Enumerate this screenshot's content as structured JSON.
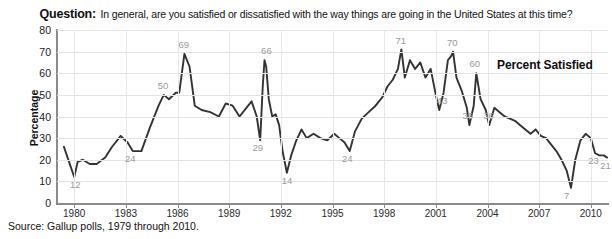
{
  "title": {
    "question_label": "Question:",
    "question_text": "In general, are you satisfied or dissatisfied with the way things are going in the United States at this time?"
  },
  "callout": {
    "text": "Percent Satisfied"
  },
  "source": {
    "text": "Source: Gallup polls, 1979 through 2010."
  },
  "colors": {
    "line": "#333333",
    "axis": "#8b8b8b",
    "grid": "#e3e3e3",
    "data_label": "#9a9a9a",
    "text": "#111111",
    "background": "#ffffff"
  },
  "chart_data": {
    "type": "line",
    "title": "In general, are you satisfied or dissatisfied with the way things are going in the United States at this time?",
    "xlabel": "",
    "ylabel": "Percentage",
    "series_name": "Percent Satisfied",
    "xlim": [
      1979,
      2011
    ],
    "ylim": [
      0,
      80
    ],
    "ytick_values": [
      0,
      10,
      20,
      30,
      40,
      50,
      60,
      70,
      80
    ],
    "ytick_labels": [
      "0",
      "10",
      "20",
      "30",
      "40",
      "50",
      "60",
      "70",
      "80"
    ],
    "xtick_values": [
      1980,
      1983,
      1986,
      1989,
      1992,
      1995,
      1998,
      2001,
      2004,
      2007,
      2010
    ],
    "xtick_labels": [
      "1980",
      "1983",
      "1986",
      "1989",
      "1992",
      "1995",
      "1998",
      "2001",
      "2004",
      "2007",
      "2010"
    ],
    "grid": true,
    "legend": "none",
    "annotations": [
      {
        "label": "12",
        "x": 1980.1,
        "y": 12,
        "note": "low, 1980"
      },
      {
        "label": "24",
        "x": 1983.3,
        "y": 24,
        "note": "1983 trough"
      },
      {
        "label": "50",
        "x": 1985.2,
        "y": 50,
        "note": "1985 rise"
      },
      {
        "label": "69",
        "x": 1986.4,
        "y": 69,
        "note": "1986 peak"
      },
      {
        "label": "29",
        "x": 1990.7,
        "y": 29,
        "note": "pre Gulf War dip"
      },
      {
        "label": "66",
        "x": 1991.2,
        "y": 66,
        "note": "Gulf War peak"
      },
      {
        "label": "14",
        "x": 1992.4,
        "y": 14,
        "note": "1992 low"
      },
      {
        "label": "24",
        "x": 1995.9,
        "y": 24,
        "note": "1995/96 dip"
      },
      {
        "label": "71",
        "x": 1999.0,
        "y": 71,
        "note": "1999 peak"
      },
      {
        "label": "70",
        "x": 2002.0,
        "y": 70,
        "note": "post-9/11 peak"
      },
      {
        "label": "43",
        "x": 2001.4,
        "y": 43,
        "note": "pre-9/11"
      },
      {
        "label": "60",
        "x": 2003.3,
        "y": 60,
        "note": "Iraq war rally"
      },
      {
        "label": "36",
        "x": 2002.9,
        "y": 36,
        "note": "2002 trough"
      },
      {
        "label": "36",
        "x": 2004.1,
        "y": 36,
        "note": "2004 level"
      },
      {
        "label": "7",
        "x": 2008.8,
        "y": 7,
        "note": "financial crisis low"
      },
      {
        "label": "23",
        "x": 2010.2,
        "y": 23,
        "note": "2010 level"
      },
      {
        "label": "21",
        "x": 2010.9,
        "y": 21,
        "note": "end of series"
      }
    ],
    "x": [
      1979.4,
      1979.7,
      1980.0,
      1980.2,
      1980.5,
      1980.9,
      1981.3,
      1981.8,
      1982.2,
      1982.7,
      1983.1,
      1983.4,
      1983.9,
      1984.4,
      1984.9,
      1985.2,
      1985.5,
      1985.9,
      1986.1,
      1986.4,
      1986.7,
      1987.0,
      1987.4,
      1987.9,
      1988.4,
      1988.8,
      1989.2,
      1989.6,
      1990.0,
      1990.3,
      1990.6,
      1990.8,
      1990.95,
      1991.05,
      1991.15,
      1991.3,
      1991.5,
      1991.7,
      1991.9,
      1992.1,
      1992.35,
      1992.6,
      1992.9,
      1993.2,
      1993.5,
      1993.9,
      1994.3,
      1994.7,
      1995.1,
      1995.4,
      1995.7,
      1996.0,
      1996.3,
      1996.7,
      1997.1,
      1997.5,
      1997.9,
      1998.2,
      1998.5,
      1998.8,
      1999.0,
      1999.2,
      1999.5,
      1999.8,
      2000.1,
      2000.4,
      2000.7,
      2001.0,
      2001.2,
      2001.45,
      2001.7,
      2001.9,
      2002.0,
      2002.2,
      2002.5,
      2002.8,
      2002.95,
      2003.2,
      2003.35,
      2003.6,
      2003.9,
      2004.1,
      2004.4,
      2004.7,
      2005.0,
      2005.3,
      2005.6,
      2005.9,
      2006.2,
      2006.5,
      2006.8,
      2007.1,
      2007.4,
      2007.7,
      2008.0,
      2008.3,
      2008.6,
      2008.85,
      2009.1,
      2009.4,
      2009.7,
      2010.0,
      2010.25,
      2010.5,
      2010.75,
      2010.95
    ],
    "y": [
      26,
      19,
      12,
      19,
      20,
      18,
      18,
      21,
      26,
      31,
      28,
      24,
      24,
      35,
      45,
      50,
      48,
      51,
      51,
      69,
      63,
      45,
      43,
      42,
      40,
      46,
      45,
      40,
      44,
      47,
      40,
      29,
      54,
      66,
      63,
      48,
      40,
      41,
      36,
      24,
      14,
      22,
      29,
      34,
      30,
      32,
      30,
      29,
      32,
      30,
      28,
      24,
      33,
      39,
      42,
      45,
      49,
      54,
      57,
      62,
      71,
      58,
      66,
      62,
      65,
      58,
      62,
      50,
      43,
      51,
      66,
      68,
      70,
      58,
      52,
      44,
      36,
      45,
      60,
      48,
      43,
      36,
      44,
      42,
      40,
      39,
      38,
      36,
      34,
      32,
      34,
      31,
      30,
      27,
      24,
      20,
      15,
      7,
      20,
      29,
      32,
      30,
      23,
      22,
      22,
      21
    ]
  }
}
